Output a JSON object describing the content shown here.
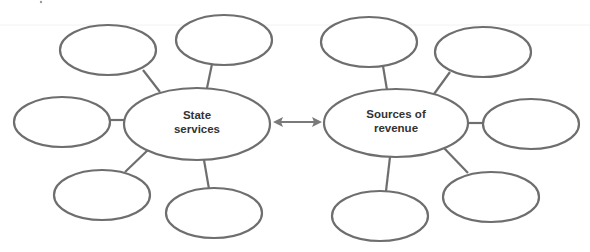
{
  "diagram": {
    "type": "double-bubble-web",
    "connector": "bidirectional-arrow",
    "colors": {
      "stroke": "#6e6e6e",
      "text": "#333333",
      "arrow": "#7a7a7a",
      "background": "#ffffff"
    },
    "left_hub": {
      "label_line1": "State",
      "label_line2": "services",
      "cx": 197,
      "cy": 124,
      "rx": 73,
      "ry": 36,
      "satellites": [
        {
          "cx": 108,
          "cy": 50,
          "rx": 48,
          "ry": 25,
          "label": ""
        },
        {
          "cx": 224,
          "cy": 40,
          "rx": 48,
          "ry": 25,
          "label": ""
        },
        {
          "cx": 62,
          "cy": 122,
          "rx": 48,
          "ry": 25,
          "label": ""
        },
        {
          "cx": 102,
          "cy": 195,
          "rx": 48,
          "ry": 25,
          "label": ""
        },
        {
          "cx": 214,
          "cy": 213,
          "rx": 48,
          "ry": 25,
          "label": ""
        }
      ]
    },
    "right_hub": {
      "label_line1": "Sources of",
      "label_line2": "revenue",
      "cx": 396,
      "cy": 123,
      "rx": 72,
      "ry": 34,
      "satellites": [
        {
          "cx": 369,
          "cy": 42,
          "rx": 48,
          "ry": 25,
          "label": ""
        },
        {
          "cx": 483,
          "cy": 52,
          "rx": 48,
          "ry": 25,
          "label": ""
        },
        {
          "cx": 531,
          "cy": 124,
          "rx": 48,
          "ry": 25,
          "label": ""
        },
        {
          "cx": 491,
          "cy": 197,
          "rx": 48,
          "ry": 25,
          "label": ""
        },
        {
          "cx": 380,
          "cy": 216,
          "rx": 48,
          "ry": 25,
          "label": ""
        }
      ]
    }
  }
}
